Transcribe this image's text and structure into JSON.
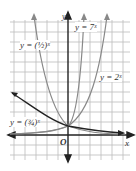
{
  "graph": {
    "axis_x_label": "x",
    "axis_y_label": "y",
    "origin_label": "O",
    "curves": [
      {
        "label": "y = (1/2)^x",
        "text": "y = (½)ˣ"
      },
      {
        "label": "y = 7^x",
        "text": "y = 7ˣ"
      },
      {
        "label": "y = 2^x",
        "text": "y = 2ˣ"
      },
      {
        "label": "y = (3/4)^x",
        "text": "y = (¾)ˣ"
      }
    ]
  }
}
